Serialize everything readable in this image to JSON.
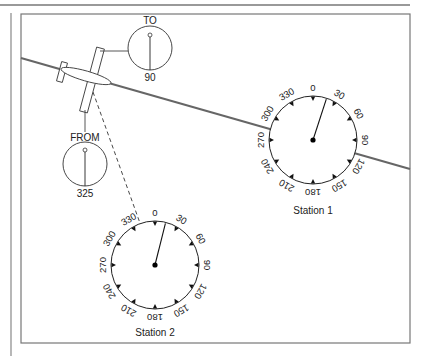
{
  "figure": {
    "colors": {
      "line": "#555555",
      "ink": "#111111",
      "frame": "#7a7a7a",
      "course": "#666666"
    }
  },
  "aircraft_indicators": {
    "to": {
      "label": "TO",
      "value": "90"
    },
    "from": {
      "label": "FROM",
      "value": "325"
    }
  },
  "stations": [
    {
      "name": "Station 1",
      "ticks": [
        "0",
        "30",
        "60",
        "90",
        "120",
        "150",
        "180",
        "210",
        "240",
        "270",
        "300",
        "330"
      ],
      "needle_bearing_deg": 18
    },
    {
      "name": "Station 2",
      "ticks": [
        "0",
        "30",
        "60",
        "90",
        "120",
        "150",
        "180",
        "210",
        "240",
        "270",
        "300",
        "330"
      ],
      "needle_bearing_deg": 14,
      "dashed_bearing_deg": 335
    }
  ]
}
